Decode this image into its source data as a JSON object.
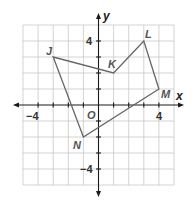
{
  "diagram": {
    "type": "coordinate-plane-polygon",
    "axes": {
      "x_label": "x",
      "y_label": "y",
      "origin_label": "O",
      "range": [
        -5,
        5
      ],
      "tick_labels": {
        "x_neg": "−4",
        "x_pos": "4",
        "y_pos": "4",
        "y_neg": "−4"
      }
    },
    "vertices": [
      {
        "label": "J",
        "x": -3,
        "y": 3
      },
      {
        "label": "K",
        "x": 1,
        "y": 2
      },
      {
        "label": "L",
        "x": 3,
        "y": 4
      },
      {
        "label": "M",
        "x": 4,
        "y": 1
      },
      {
        "label": "N",
        "x": -1,
        "y": -2
      }
    ],
    "colors": {
      "polygon_stroke": "#666666",
      "grid": "#c8c8c8",
      "axis": "#1a1a1a"
    }
  }
}
